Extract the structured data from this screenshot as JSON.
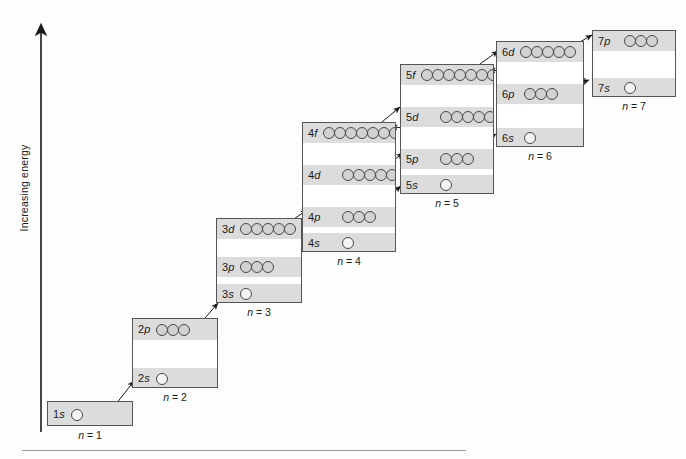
{
  "figure": {
    "axis_label": "Increasing energy",
    "axis_arrow": "up-arrow-icon"
  },
  "chart_data": {
    "type": "diagram",
    "title": "Increasing energy",
    "xlabel": "",
    "ylabel": "Increasing energy",
    "shells": [
      {
        "caption": "n = 1",
        "n": 1,
        "subshells": [
          {
            "label": "1s",
            "orbitals": 1
          }
        ]
      },
      {
        "caption": "n = 2",
        "n": 2,
        "subshells": [
          {
            "label": "2p",
            "orbitals": 3
          },
          {
            "label": "2s",
            "orbitals": 1
          }
        ]
      },
      {
        "caption": "n = 3",
        "n": 3,
        "subshells": [
          {
            "label": "3d",
            "orbitals": 5
          },
          {
            "label": "3p",
            "orbitals": 3
          },
          {
            "label": "3s",
            "orbitals": 1
          }
        ]
      },
      {
        "caption": "n = 4",
        "n": 4,
        "subshells": [
          {
            "label": "4f",
            "orbitals": 7
          },
          {
            "label": "4d",
            "orbitals": 5
          },
          {
            "label": "4p",
            "orbitals": 3
          },
          {
            "label": "4s",
            "orbitals": 1
          }
        ]
      },
      {
        "caption": "n = 5",
        "n": 5,
        "subshells": [
          {
            "label": "5f",
            "orbitals": 7
          },
          {
            "label": "5d",
            "orbitals": 5
          },
          {
            "label": "5p",
            "orbitals": 3
          },
          {
            "label": "5s",
            "orbitals": 1
          }
        ]
      },
      {
        "caption": "n = 6",
        "n": 6,
        "subshells": [
          {
            "label": "6d",
            "orbitals": 5
          },
          {
            "label": "6p",
            "orbitals": 3
          },
          {
            "label": "6s",
            "orbitals": 1
          }
        ]
      },
      {
        "caption": "n = 7",
        "n": 7,
        "subshells": [
          {
            "label": "7p",
            "orbitals": 3
          },
          {
            "label": "7s",
            "orbitals": 1
          }
        ]
      }
    ],
    "fill_order": [
      "1s",
      "2s",
      "2p",
      "3s",
      "3p",
      "4s",
      "3d",
      "4p",
      "5s",
      "4d",
      "5p",
      "6s",
      "4f",
      "5d",
      "6p",
      "7s",
      "5f",
      "6d",
      "7p"
    ]
  },
  "colors": {
    "shaded_row": "#dcdcdc",
    "orbital_fill": "#d2d2d2",
    "box_border": "#555555",
    "ink": "#1a1a1a",
    "rule": "#9a9a9a"
  }
}
